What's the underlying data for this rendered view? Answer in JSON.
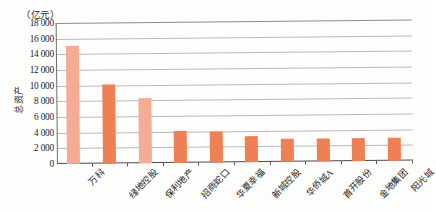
{
  "chart_data": {
    "type": "bar",
    "title": "",
    "subtitle": "",
    "unit_label": "（亿元）",
    "xlabel": "",
    "ylabel": "总资产",
    "ylim": [
      0,
      18000
    ],
    "ytick_step": 2000,
    "ytick_labels": [
      "18 000",
      "16 000",
      "14 000",
      "12 000",
      "10 000",
      "8 000",
      "6 000",
      "4 000",
      "2 000",
      "0"
    ],
    "ytick_values": [
      18000,
      16000,
      14000,
      12000,
      10000,
      8000,
      6000,
      4000,
      2000,
      0
    ],
    "grid": true,
    "legend": "none",
    "categories": [
      "万科",
      "绿地控股",
      "保利地产",
      "招商蛇口",
      "华夏幸福",
      "新城控股",
      "华侨城A",
      "首开股份",
      "金地集团",
      "阳光城"
    ],
    "values": [
      15050,
      10050,
      8350,
      4150,
      4000,
      3300,
      2950,
      3000,
      2980,
      2880
    ],
    "bar_colors": [
      "#f6ab95",
      "#ef8055",
      "#f6ab95",
      "#ef8055",
      "#ef8055",
      "#ef8055",
      "#ef8055",
      "#ef8055",
      "#ef8055",
      "#ef8055"
    ]
  },
  "colors": {
    "bar_light": "#f6ab95",
    "bar_dark": "#ef8055",
    "grid": "#b9b9b9",
    "axis": "#4a4a4a",
    "text": "#1f1f1f",
    "background": "#fdfdfc"
  }
}
